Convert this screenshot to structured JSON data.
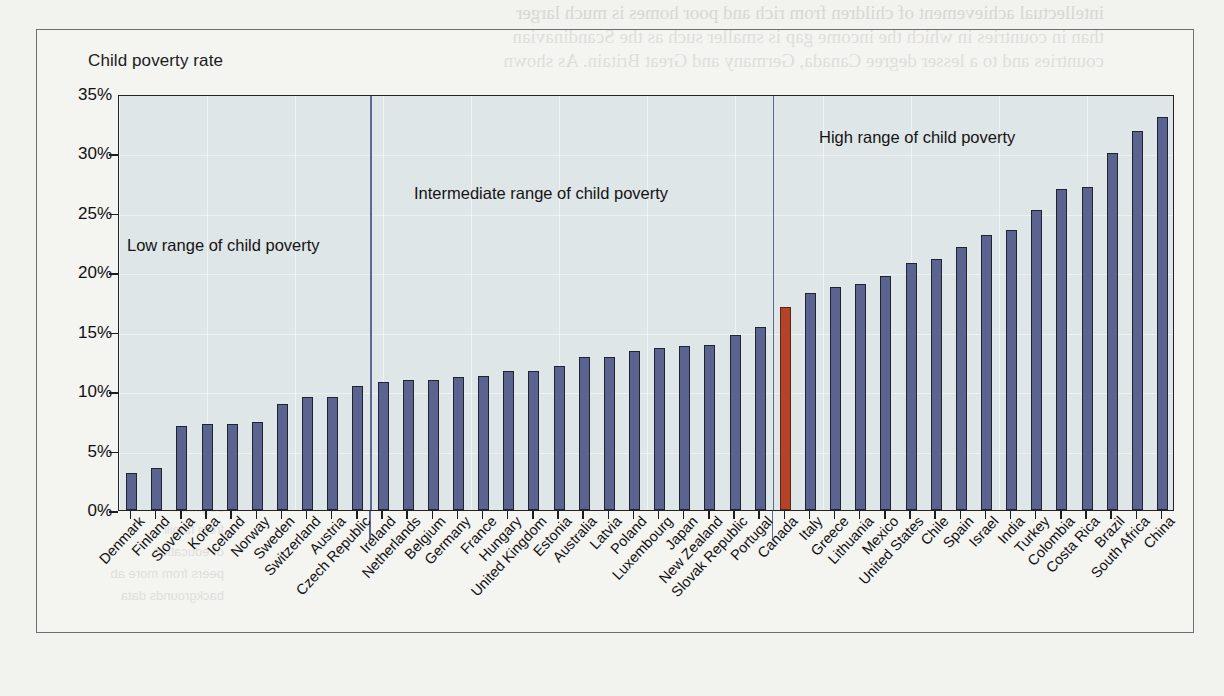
{
  "figure": {
    "axis_title": "Child poverty rate",
    "annotations": [
      {
        "name": "low-range",
        "text": "Low range of child poverty"
      },
      {
        "name": "intermediate-range",
        "text": "Intermediate range of child poverty"
      },
      {
        "name": "high-range",
        "text": "High range of child poverty"
      }
    ],
    "colors": {
      "bar": "#5b6491",
      "highlight": "#b5432a",
      "plot_bg": "#dfe6e8",
      "divider": "#5a6a93"
    },
    "highlight_country": "Canada"
  },
  "bleed_text": {
    "top_lines": [
      "intellectual achievement of children from rich and poor homes is much larger",
      "than in countries in which the income gap is smaller such as the Scandinavian",
      "countries and to a lesser degree Canada, Germany and Great Britain. As shown"
    ],
    "side_lines": [
      "Readi",
      "ntering king",
      "beginnin",
      "from famili",
      "of education",
      "peers from more ab",
      "backgrounds  data"
    ],
    "ghost_labels": [
      "30",
      "Reading scores",
      "20",
      "Maths scores"
    ]
  },
  "chart_data": {
    "type": "bar",
    "title": "",
    "xlabel": "",
    "ylabel": "Child poverty rate",
    "ylim": [
      0,
      35
    ],
    "ytick_labels": [
      "0%",
      "5%",
      "10%",
      "15%",
      "20%",
      "25%",
      "30%",
      "35%"
    ],
    "ytick_values": [
      0,
      5,
      10,
      15,
      20,
      25,
      30,
      35
    ],
    "grid": true,
    "legend": "none",
    "unit": "percent",
    "categories": [
      "Denmark",
      "Finland",
      "Slovenia",
      "Korea",
      "Iceland",
      "Norway",
      "Sweden",
      "Switzerland",
      "Austria",
      "Czech Republic",
      "Ireland",
      "Netherlands",
      "Belgium",
      "Germany",
      "France",
      "Hungary",
      "United Kingdom",
      "Estonia",
      "Australia",
      "Latvia",
      "Poland",
      "Luxembourg",
      "Japan",
      "New Zealand",
      "Slovak Republic",
      "Portugal",
      "Canada",
      "Italy",
      "Greece",
      "Lithuania",
      "Mexico",
      "United States",
      "Chile",
      "Spain",
      "Israel",
      "India",
      "Turkey",
      "Colombia",
      "Costa Rica",
      "Brazil",
      "South Africa",
      "China"
    ],
    "values": [
      3.1,
      3.5,
      7.1,
      7.2,
      7.2,
      7.4,
      8.9,
      9.5,
      9.5,
      10.4,
      10.8,
      10.9,
      10.9,
      11.2,
      11.3,
      11.7,
      11.7,
      12.1,
      12.9,
      12.9,
      13.4,
      13.6,
      13.8,
      13.9,
      14.7,
      15.4,
      17.1,
      18.3,
      18.8,
      19.0,
      19.7,
      20.8,
      21.1,
      22.1,
      23.1,
      23.6,
      25.2,
      27.0,
      27.2,
      30.0,
      31.9,
      33.1
    ],
    "highlighted_index": 26,
    "group_dividers_after": [
      9,
      25
    ],
    "groups": [
      {
        "label": "Low range of child poverty",
        "start": 0,
        "end": 9
      },
      {
        "label": "Intermediate range of child poverty",
        "start": 10,
        "end": 25
      },
      {
        "label": "High range of child poverty",
        "start": 26,
        "end": 41
      }
    ]
  }
}
